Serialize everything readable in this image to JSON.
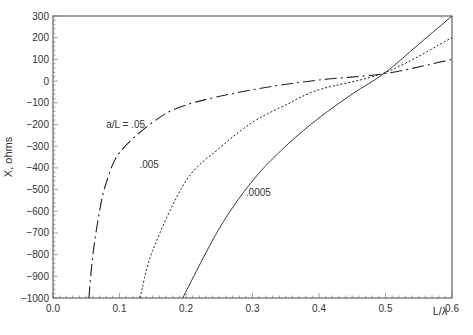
{
  "chart_data": {
    "type": "line",
    "title": "",
    "xlabel": "L/λ",
    "ylabel": "X, ohms",
    "xlim": [
      0.0,
      0.6
    ],
    "ylim": [
      -1000,
      300
    ],
    "x_ticks": [
      "0.0",
      "0.1",
      "0.2",
      "0.3",
      "0.4",
      "0.5",
      "0.6"
    ],
    "y_ticks": [
      "300",
      "200",
      "100",
      "0",
      "-100",
      "-200",
      "-300",
      "-400",
      "-500",
      "-600",
      "-700",
      "-800",
      "-900",
      "-1000"
    ],
    "grid": false,
    "series": [
      {
        "name": "a/L = .05",
        "style": "dash-dot",
        "x": [
          0.054,
          0.06,
          0.07,
          0.08,
          0.1,
          0.15,
          0.2,
          0.3,
          0.4,
          0.5,
          0.6
        ],
        "y": [
          -1000,
          -800,
          -600,
          -470,
          -330,
          -190,
          -110,
          -40,
          5,
          35,
          100
        ]
      },
      {
        "name": ".005",
        "style": "dotted",
        "x": [
          0.131,
          0.15,
          0.2,
          0.25,
          0.3,
          0.35,
          0.4,
          0.5,
          0.6
        ],
        "y": [
          -1000,
          -780,
          -460,
          -310,
          -190,
          -110,
          -40,
          40,
          200
        ]
      },
      {
        "name": ".0005",
        "style": "solid",
        "x": [
          0.195,
          0.25,
          0.3,
          0.35,
          0.4,
          0.45,
          0.5,
          0.55,
          0.6
        ],
        "y": [
          -1000,
          -680,
          -460,
          -300,
          -170,
          -60,
          40,
          170,
          300
        ]
      }
    ],
    "annotations": [
      {
        "text": "a/L = .05",
        "x": 0.08,
        "y": -215
      },
      {
        "text": ".005",
        "x": 0.13,
        "y": -400
      },
      {
        "text": ".0005",
        "x": 0.29,
        "y": -530
      }
    ]
  }
}
